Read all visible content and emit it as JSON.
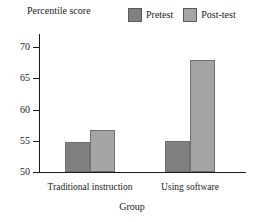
{
  "chart_data": {
    "type": "bar",
    "title": "",
    "subtitle": "",
    "xlabel": "Group",
    "ylabel": "Percentile score",
    "categories": [
      "Traditional instruction",
      "Using software"
    ],
    "series": [
      {
        "name": "Pretest",
        "color": "#808080",
        "values": [
          54.8,
          54.9
        ]
      },
      {
        "name": "Post-test",
        "color": "#a5a5a5",
        "values": [
          56.7,
          67.9
        ]
      }
    ],
    "ylim": [
      50,
      70
    ],
    "yticks": [
      50,
      55,
      60,
      65,
      70
    ],
    "ytick_labels": [
      "50",
      "55",
      "60",
      "65",
      "70"
    ],
    "grid": false,
    "legend_position": "top-right",
    "annotations": []
  },
  "axes": {
    "y_title": "Percentile score",
    "x_title": "Group"
  },
  "legend": {
    "entries": [
      {
        "label": "Pretest",
        "swatch_color": "#808080"
      },
      {
        "label": "Post-test",
        "swatch_color": "#a5a5a5"
      }
    ]
  }
}
